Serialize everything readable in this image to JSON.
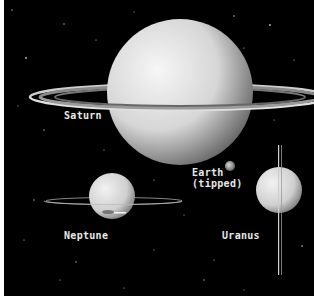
{
  "image": {
    "description": "Planet size comparison on starfield showing ring systems",
    "background_color": "#000000"
  },
  "planets": [
    {
      "name": "saturn",
      "label": "Saturn"
    },
    {
      "name": "earth",
      "label": "Earth\n(tipped)"
    },
    {
      "name": "neptune",
      "label": "Neptune"
    },
    {
      "name": "uranus",
      "label": "Uranus"
    }
  ]
}
